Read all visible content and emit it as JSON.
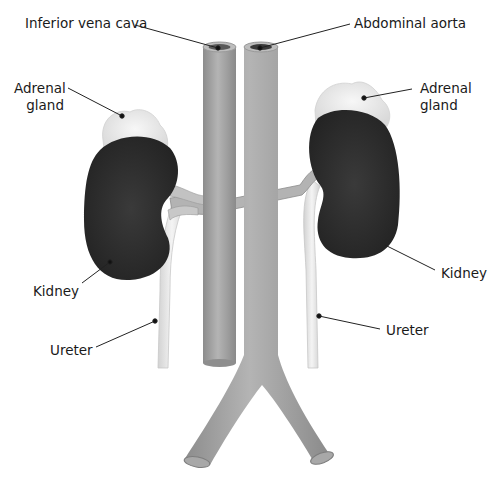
{
  "diagram": {
    "type": "anatomical-illustration",
    "labels": {
      "inferior_vena_cava": "Inferior vena cava",
      "abdominal_aorta": "Abdominal aorta",
      "adrenal_gland_left_line1": "Adrenal",
      "adrenal_gland_left_line2": "gland",
      "adrenal_gland_right_line1": "Adrenal",
      "adrenal_gland_right_line2": "gland",
      "kidney_left": "Kidney",
      "kidney_right": "Kidney",
      "ureter_left": "Ureter",
      "ureter_right": "Ureter"
    },
    "colors": {
      "vessel": "#9a9a9a",
      "vessel_light": "#bdbdbd",
      "kidney": "#2e2e2e",
      "gland": "#ececec",
      "ureter": "#e6e6e6",
      "leader_line": "#222222"
    }
  }
}
